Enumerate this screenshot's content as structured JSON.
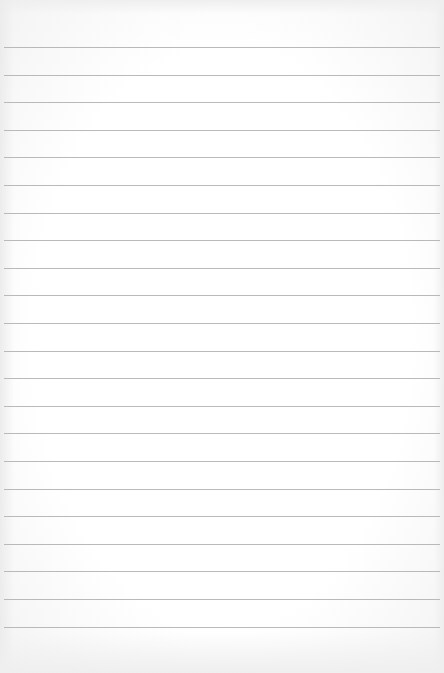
{
  "paper": {
    "type": "lined-notepad",
    "line_count": 22,
    "first_line_y": 47,
    "line_spacing": 27.6,
    "line_color": "#b9b9b9",
    "background_color": "#ffffff"
  }
}
